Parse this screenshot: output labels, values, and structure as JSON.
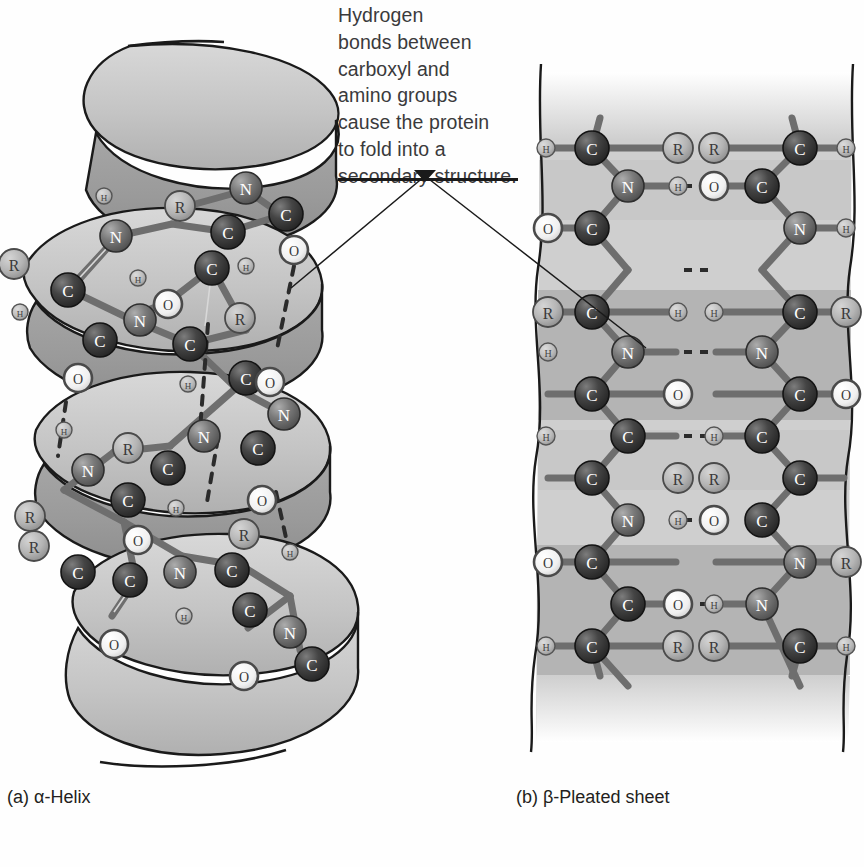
{
  "figure": {
    "caption": "Hydrogen bonds between carboxyl and amino groups cause the protein to fold into a secondary structure.",
    "caption_lines": [
      "Hydrogen",
      "bonds between",
      "carboxyl and",
      "amino groups",
      "cause the protein",
      "to fold into a",
      "secondary structure."
    ],
    "panels": [
      {
        "id": "a",
        "label": "(a) α-Helix",
        "structure": "alpha-helix"
      },
      {
        "id": "b",
        "label": "(b) β-Pleated sheet",
        "structure": "beta-pleated-sheet"
      }
    ],
    "atom_labels": {
      "carbon": "C",
      "nitrogen": "N",
      "oxygen": "O",
      "hydrogen": "H",
      "sidechain": "R"
    },
    "colors": {
      "carbon": "#3b3b3b",
      "nitrogen": "#6e6e6e",
      "oxygen": "#ededed",
      "hydrogen": "#b9b9b9",
      "sidechain": "#b0b0b0",
      "ribbon_light": "#c9c9c9",
      "ribbon_mid": "#b2b2b2",
      "ribbon_dark": "#9a9a9a",
      "sheet_light": "#cccccc",
      "sheet_dark": "#a8a8a8",
      "bond": "#6a6a6a",
      "outline": "#1a1a1a",
      "hbond": "#2b2b2b",
      "text": "#3a3a3c",
      "label_text": "#231f20",
      "background": "#fefefe"
    },
    "leader": {
      "anchor_label": "caption-anchor",
      "targets": [
        "alpha-helix-hydrogen-bond",
        "beta-sheet-hydrogen-bond"
      ]
    },
    "helix": {
      "turns": 4,
      "hydrogen_bonds": 4,
      "residues": [
        {
          "atoms": [
            "N",
            "C",
            "R",
            "C",
            "O",
            "H"
          ]
        },
        {
          "atoms": [
            "N",
            "C",
            "R",
            "C",
            "O",
            "H"
          ]
        },
        {
          "atoms": [
            "N",
            "C",
            "R",
            "C",
            "O",
            "H"
          ]
        },
        {
          "atoms": [
            "N",
            "C",
            "R",
            "C",
            "O",
            "H"
          ]
        }
      ]
    },
    "sheet": {
      "strands": 2,
      "orientation": "antiparallel",
      "rows": 8,
      "hydrogen_bonds": 4,
      "pleat_bands": [
        "light",
        "light",
        "dark",
        "light",
        "dark",
        "light"
      ]
    }
  }
}
